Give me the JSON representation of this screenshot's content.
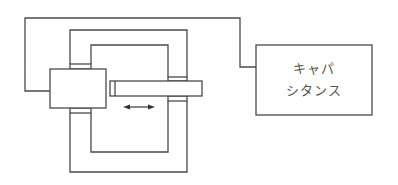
{
  "diagram": {
    "type": "capacitive displacement sensor schematic",
    "capacitance_box": {
      "label_line1": "キャパ",
      "label_line2": "シタンス"
    },
    "motion_arrow": "double-headed horizontal arrow",
    "colors": {
      "line": "#4a4a4a",
      "text": "#555555",
      "background": "#ffffff"
    }
  }
}
